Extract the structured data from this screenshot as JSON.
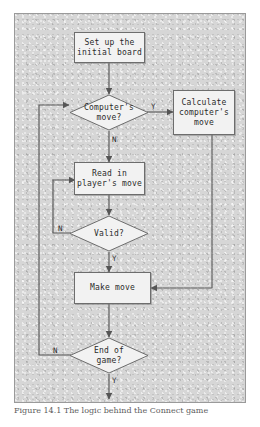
{
  "figure": {
    "type": "flowchart",
    "caption": "Figure 14.1  The logic behind the Connect game",
    "frame": {
      "border_color": "#9a9a9a",
      "background_color": "#d6d6d6"
    },
    "node_fill": "#f2f2f2",
    "node_border": "#6d6d6d",
    "line_color": "#555555",
    "nodes": [
      {
        "id": "setup",
        "shape": "process",
        "label": "Set up the\ninitial board"
      },
      {
        "id": "compmove",
        "shape": "decision",
        "label": "Computer's\nmove?"
      },
      {
        "id": "calc",
        "shape": "process",
        "label": "Calculate\ncomputer's\nmove"
      },
      {
        "id": "readin",
        "shape": "process",
        "label": "Read in\nplayer's move"
      },
      {
        "id": "valid",
        "shape": "decision",
        "label": "Valid?"
      },
      {
        "id": "makemove",
        "shape": "process",
        "label": "Make move"
      },
      {
        "id": "endgame",
        "shape": "decision",
        "label": "End of\ngame?"
      }
    ],
    "edges": [
      {
        "from": "setup",
        "to": "compmove",
        "label": ""
      },
      {
        "from": "compmove",
        "to": "calc",
        "label": "Y"
      },
      {
        "from": "compmove",
        "to": "readin",
        "label": "N"
      },
      {
        "from": "calc",
        "to": "makemove",
        "label": ""
      },
      {
        "from": "readin",
        "to": "valid",
        "label": ""
      },
      {
        "from": "valid",
        "to": "readin",
        "label": "N"
      },
      {
        "from": "valid",
        "to": "makemove",
        "label": "Y"
      },
      {
        "from": "makemove",
        "to": "endgame",
        "label": ""
      },
      {
        "from": "endgame",
        "to": "compmove",
        "label": "N"
      },
      {
        "from": "endgame",
        "to": "exit",
        "label": "Y"
      }
    ],
    "edge_labels": {
      "computer_yes": "Y",
      "computer_no": "N",
      "valid_no": "N",
      "valid_yes": "Y",
      "end_no": "N",
      "end_yes": "Y"
    }
  }
}
